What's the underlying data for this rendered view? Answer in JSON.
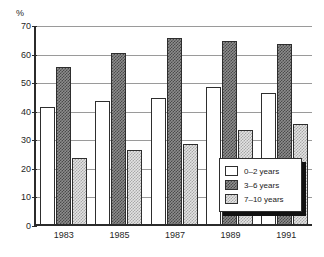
{
  "title_remnant": "",
  "y_unit_label": "%",
  "chart_data": {
    "type": "bar",
    "title": "",
    "subtitle": "",
    "xlabel": "",
    "ylabel": "%",
    "ylim": [
      0,
      70
    ],
    "yticks": [
      0,
      10,
      20,
      30,
      40,
      50,
      60,
      70
    ],
    "grid": true,
    "legend_position": "inside-bottom-right",
    "categories": [
      "1983",
      "1985",
      "1987",
      "1989",
      "1991"
    ],
    "series": [
      {
        "name": "0–2 years",
        "values": [
          41,
          43,
          44,
          48,
          46
        ],
        "fill": "white",
        "color": "#ffffff"
      },
      {
        "name": "3–6 years",
        "values": [
          55,
          60,
          65,
          64,
          63
        ],
        "fill": "dark-checker",
        "color": "#6e6e6e"
      },
      {
        "name": "7–10 years",
        "values": [
          23,
          26,
          28,
          33,
          35
        ],
        "fill": "light-dotted",
        "color": "#d8d8d8"
      }
    ]
  },
  "legend": {
    "items": [
      {
        "label": "0–2 years"
      },
      {
        "label": "3–6 years"
      },
      {
        "label": "7–10 years"
      }
    ]
  }
}
